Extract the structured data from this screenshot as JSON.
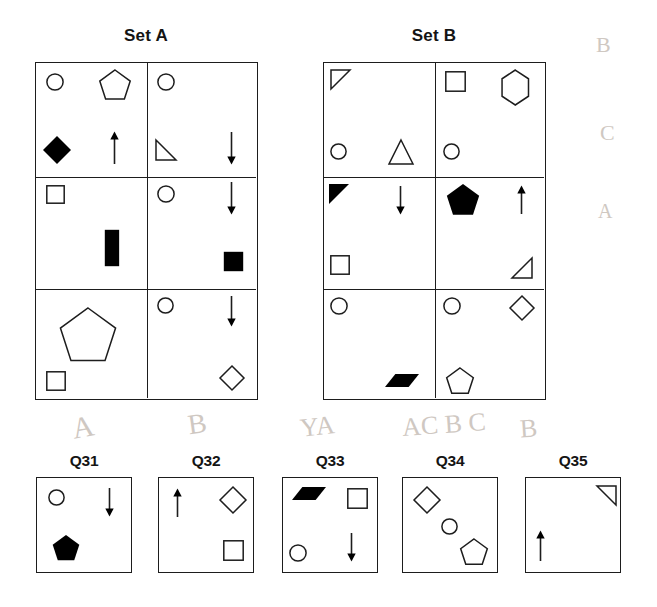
{
  "page": {
    "background": "#ffffff",
    "ink": "#1d1d1d",
    "fill": "#000000"
  },
  "sets": [
    {
      "id": "set-a",
      "title": "Set A",
      "title_x": 146,
      "title_y": 26,
      "box": {
        "x": 35,
        "y": 62,
        "w": 223,
        "h": 338
      },
      "col_split": 111,
      "row_splits": [
        114,
        226
      ],
      "cells": [
        {
          "name": "set-a-cell-r1c1",
          "shapes": [
            {
              "name": "circle-outline",
              "type": "circle",
              "fill": "none",
              "x": 10,
              "y": 10,
              "size": 18,
              "rot": 0
            },
            {
              "name": "pentagon-outline",
              "type": "pentagon",
              "fill": "none",
              "x": 62,
              "y": 6,
              "size": 34,
              "rot": 0
            },
            {
              "name": "diamond-filled",
              "type": "diamond",
              "fill": "solid",
              "x": 6,
              "y": 72,
              "size": 30,
              "rot": 0
            },
            {
              "name": "arrow-up",
              "type": "arrow-up",
              "fill": "none",
              "x": 72,
              "y": 68,
              "size": 34,
              "rot": 0
            }
          ]
        },
        {
          "name": "set-a-cell-r1c2",
          "shapes": [
            {
              "name": "circle-outline",
              "type": "circle",
              "fill": "none",
              "x": 10,
              "y": 10,
              "size": 18,
              "rot": 0
            },
            {
              "name": "triangle-right-outline",
              "type": "triangle-rt",
              "fill": "none",
              "x": 8,
              "y": 76,
              "size": 22,
              "rot": 0
            },
            {
              "name": "arrow-down",
              "type": "arrow-down",
              "fill": "none",
              "x": 78,
              "y": 68,
              "size": 34,
              "rot": 0
            }
          ]
        },
        {
          "name": "set-a-cell-r2c1",
          "shapes": [
            {
              "name": "square-outline",
              "type": "square",
              "fill": "none",
              "x": 10,
              "y": 8,
              "size": 19,
              "rot": 0
            },
            {
              "name": "rectangle-filled",
              "type": "rect-v",
              "fill": "solid",
              "x": 68,
              "y": 52,
              "size": 38,
              "rot": 0
            }
          ]
        },
        {
          "name": "set-a-cell-r2c2",
          "shapes": [
            {
              "name": "circle-outline",
              "type": "circle",
              "fill": "none",
              "x": 10,
              "y": 8,
              "size": 18,
              "rot": 0
            },
            {
              "name": "arrow-down",
              "type": "arrow-down",
              "fill": "none",
              "x": 78,
              "y": 4,
              "size": 34,
              "rot": 0
            },
            {
              "name": "square-filled",
              "type": "square",
              "fill": "solid",
              "x": 76,
              "y": 74,
              "size": 21,
              "rot": 0
            }
          ]
        },
        {
          "name": "set-a-cell-r3c1",
          "shapes": [
            {
              "name": "pentagon-outline",
              "type": "pentagon",
              "fill": "none",
              "x": 22,
              "y": 18,
              "size": 60,
              "rot": 0
            },
            {
              "name": "square-outline",
              "type": "square",
              "fill": "none",
              "x": 10,
              "y": 82,
              "size": 20,
              "rot": 0
            }
          ]
        },
        {
          "name": "set-a-cell-r3c2",
          "shapes": [
            {
              "name": "circle-outline",
              "type": "circle",
              "fill": "none",
              "x": 10,
              "y": 8,
              "size": 17,
              "rot": 0
            },
            {
              "name": "arrow-down",
              "type": "arrow-down",
              "fill": "none",
              "x": 78,
              "y": 6,
              "size": 32,
              "rot": 0
            },
            {
              "name": "diamond-outline",
              "type": "diamond",
              "fill": "none",
              "x": 72,
              "y": 76,
              "size": 26,
              "rot": 0
            }
          ]
        }
      ]
    },
    {
      "id": "set-b",
      "title": "Set B",
      "title_x": 434,
      "title_y": 26,
      "box": {
        "x": 323,
        "y": 62,
        "w": 223,
        "h": 338
      },
      "col_split": 111,
      "row_splits": [
        114,
        226
      ],
      "cells": [
        {
          "name": "set-b-cell-r1c1",
          "shapes": [
            {
              "name": "triangle-right-outline",
              "type": "triangle-tl",
              "fill": "none",
              "x": 6,
              "y": 6,
              "size": 21,
              "rot": 0
            },
            {
              "name": "circle-outline",
              "type": "circle",
              "fill": "none",
              "x": 6,
              "y": 80,
              "size": 17,
              "rot": 0
            },
            {
              "name": "triangle-up-outline",
              "type": "triangle-up",
              "fill": "none",
              "x": 64,
              "y": 76,
              "size": 26,
              "rot": 0
            }
          ]
        },
        {
          "name": "set-b-cell-r1c2",
          "shapes": [
            {
              "name": "square-outline",
              "type": "square",
              "fill": "none",
              "x": 10,
              "y": 8,
              "size": 21,
              "rot": 0
            },
            {
              "name": "hexagon-outline",
              "type": "hexagon",
              "fill": "none",
              "x": 64,
              "y": 6,
              "size": 37,
              "rot": 0
            },
            {
              "name": "circle-outline",
              "type": "circle",
              "fill": "none",
              "x": 8,
              "y": 80,
              "size": 17,
              "rot": 0
            }
          ]
        },
        {
          "name": "set-b-cell-r2c1",
          "shapes": [
            {
              "name": "triangle-right-filled",
              "type": "triangle-tl",
              "fill": "solid",
              "x": 4,
              "y": 6,
              "size": 22,
              "rot": 0
            },
            {
              "name": "arrow-down",
              "type": "arrow-down",
              "fill": "none",
              "x": 70,
              "y": 8,
              "size": 30,
              "rot": 0
            },
            {
              "name": "square-outline",
              "type": "square",
              "fill": "none",
              "x": 6,
              "y": 78,
              "size": 20,
              "rot": 0
            }
          ]
        },
        {
          "name": "set-b-cell-r2c2",
          "shapes": [
            {
              "name": "pentagon-filled",
              "type": "pentagon",
              "fill": "solid",
              "x": 10,
              "y": 6,
              "size": 36,
              "rot": 0
            },
            {
              "name": "arrow-up",
              "type": "arrow-up",
              "fill": "none",
              "x": 80,
              "y": 8,
              "size": 30,
              "rot": 0
            },
            {
              "name": "triangle-right-outline",
              "type": "triangle-br",
              "fill": "none",
              "x": 76,
              "y": 80,
              "size": 22,
              "rot": 0
            }
          ]
        },
        {
          "name": "set-b-cell-r3c1",
          "shapes": [
            {
              "name": "circle-outline",
              "type": "circle",
              "fill": "none",
              "x": 6,
              "y": 8,
              "size": 18,
              "rot": 0
            },
            {
              "name": "parallelogram-filled",
              "type": "parallelogram",
              "fill": "solid",
              "x": 60,
              "y": 84,
              "size": 36,
              "rot": 0
            }
          ]
        },
        {
          "name": "set-b-cell-r3c2",
          "shapes": [
            {
              "name": "circle-outline",
              "type": "circle",
              "fill": "none",
              "x": 8,
              "y": 8,
              "size": 18,
              "rot": 0
            },
            {
              "name": "diamond-outline",
              "type": "diamond",
              "fill": "none",
              "x": 74,
              "y": 6,
              "size": 26,
              "rot": 0
            },
            {
              "name": "pentagon-outline",
              "type": "pentagon",
              "fill": "none",
              "x": 10,
              "y": 78,
              "size": 30,
              "rot": 0
            }
          ]
        }
      ]
    }
  ],
  "questions": [
    {
      "id": "q31",
      "label": "Q31",
      "x": 36,
      "y": 477,
      "label_y": 452,
      "shapes": [
        {
          "name": "circle-outline",
          "type": "circle",
          "fill": "none",
          "x": 11,
          "y": 11,
          "size": 17,
          "rot": 0
        },
        {
          "name": "arrow-down",
          "type": "arrow-down",
          "fill": "none",
          "x": 66,
          "y": 9,
          "size": 30,
          "rot": 0
        },
        {
          "name": "pentagon-filled",
          "type": "pentagon",
          "fill": "solid",
          "x": 14,
          "y": 56,
          "size": 30,
          "rot": 0
        }
      ]
    },
    {
      "id": "q32",
      "label": "Q32",
      "x": 158,
      "y": 477,
      "label_y": 452,
      "shapes": [
        {
          "name": "arrow-up",
          "type": "arrow-up",
          "fill": "none",
          "x": 12,
          "y": 10,
          "size": 30,
          "rot": 0
        },
        {
          "name": "diamond-outline",
          "type": "diamond",
          "fill": "none",
          "x": 60,
          "y": 8,
          "size": 28,
          "rot": 0
        },
        {
          "name": "square-outline",
          "type": "square",
          "fill": "none",
          "x": 64,
          "y": 62,
          "size": 21,
          "rot": 0
        }
      ]
    },
    {
      "id": "q33",
      "label": "Q33",
      "x": 282,
      "y": 477,
      "label_y": 452,
      "shapes": [
        {
          "name": "parallelogram-filled",
          "type": "parallelogram",
          "fill": "solid",
          "x": 8,
          "y": 8,
          "size": 36,
          "rot": 0
        },
        {
          "name": "square-outline",
          "type": "square",
          "fill": "none",
          "x": 64,
          "y": 10,
          "size": 21,
          "rot": 0
        },
        {
          "name": "circle-outline",
          "type": "circle",
          "fill": "none",
          "x": 6,
          "y": 66,
          "size": 18,
          "rot": 0
        },
        {
          "name": "arrow-down",
          "type": "arrow-down",
          "fill": "none",
          "x": 62,
          "y": 54,
          "size": 30,
          "rot": 0
        }
      ]
    },
    {
      "id": "q34",
      "label": "Q34",
      "x": 402,
      "y": 477,
      "label_y": 452,
      "shapes": [
        {
          "name": "diamond-outline",
          "type": "diamond",
          "fill": "none",
          "x": 10,
          "y": 8,
          "size": 28,
          "rot": 0
        },
        {
          "name": "circle-outline",
          "type": "circle",
          "fill": "none",
          "x": 38,
          "y": 40,
          "size": 17,
          "rot": 0
        },
        {
          "name": "pentagon-outline",
          "type": "pentagon",
          "fill": "none",
          "x": 56,
          "y": 60,
          "size": 30,
          "rot": 0
        }
      ]
    },
    {
      "id": "q35",
      "label": "Q35",
      "x": 525,
      "y": 477,
      "label_y": 452,
      "shapes": [
        {
          "name": "triangle-right-outline",
          "type": "triangle-tr",
          "fill": "none",
          "x": 70,
          "y": 7,
          "size": 21,
          "rot": 0
        },
        {
          "name": "arrow-up",
          "type": "arrow-up",
          "fill": "none",
          "x": 8,
          "y": 52,
          "size": 32,
          "rot": 0
        }
      ]
    }
  ],
  "background_marks": [
    {
      "name": "pencil-mark-a",
      "text": "A",
      "x": 72,
      "y": 410,
      "size": 30,
      "rot": -10
    },
    {
      "name": "pencil-mark-b",
      "text": "B",
      "x": 188,
      "y": 408,
      "size": 28,
      "rot": -8
    },
    {
      "name": "pencil-mark-ya",
      "text": "YA",
      "x": 300,
      "y": 412,
      "size": 26,
      "rot": -6
    },
    {
      "name": "pencil-mark-acbc",
      "text": "AC B C",
      "x": 402,
      "y": 410,
      "size": 26,
      "rot": -4
    },
    {
      "name": "pencil-mark-b2",
      "text": "B",
      "x": 520,
      "y": 414,
      "size": 26,
      "rot": -4
    },
    {
      "name": "pencil-mark-edge",
      "text": "B",
      "x": 596,
      "y": 32,
      "size": 22,
      "rot": 0
    },
    {
      "name": "pencil-mark-edge2",
      "text": "C",
      "x": 600,
      "y": 120,
      "size": 22,
      "rot": 0
    },
    {
      "name": "pencil-mark-edge3",
      "text": "A",
      "x": 598,
      "y": 200,
      "size": 20,
      "rot": 0
    }
  ]
}
